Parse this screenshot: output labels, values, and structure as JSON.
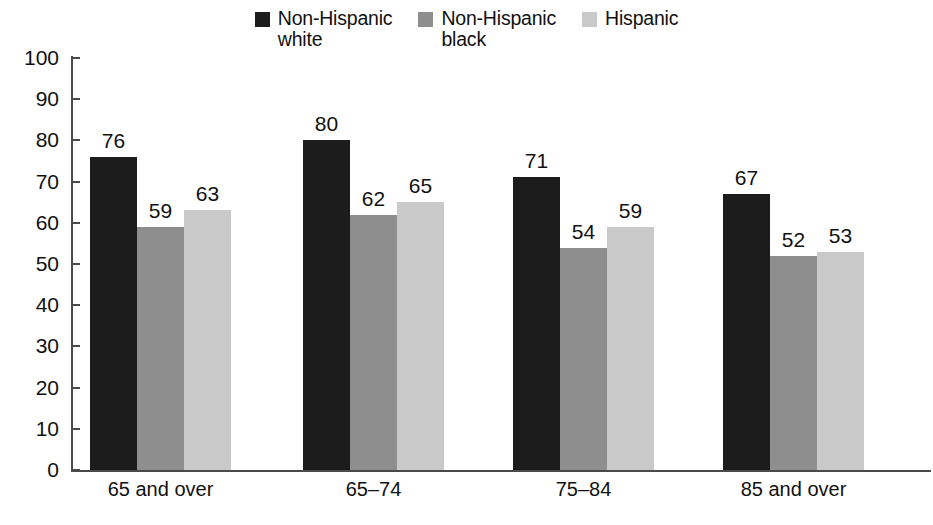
{
  "chart_data": {
    "type": "bar",
    "title": "",
    "subtitle": "",
    "xlabel": "",
    "ylabel": "",
    "ylim": [
      0,
      100
    ],
    "ytick_step": 10,
    "yticks": [
      "100",
      "90",
      "80",
      "70",
      "60",
      "50",
      "40",
      "30",
      "20",
      "10",
      "0"
    ],
    "grid": false,
    "legend_position": "top-center",
    "categories": [
      "65 and over",
      "65–74",
      "75–84",
      "85 and over"
    ],
    "series": [
      {
        "name": "Non-Hispanic white",
        "legend_line1": "Non-Hispanic",
        "legend_line2": "white",
        "color": "#1c1c1c",
        "values": [
          76,
          80,
          71,
          67
        ]
      },
      {
        "name": "Non-Hispanic black",
        "legend_line1": "Non-Hispanic",
        "legend_line2": "black",
        "color": "#8e8e8e",
        "values": [
          59,
          62,
          54,
          52
        ]
      },
      {
        "name": "Hispanic",
        "legend_line1": "Hispanic",
        "legend_line2": "",
        "color": "#c9c9c9",
        "values": [
          63,
          65,
          59,
          53
        ]
      }
    ],
    "data_labels": [
      [
        "76",
        "59",
        "63"
      ],
      [
        "80",
        "62",
        "65"
      ],
      [
        "71",
        "54",
        "59"
      ],
      [
        "67",
        "52",
        "53"
      ]
    ],
    "axis_color": "#4a4a4a"
  }
}
